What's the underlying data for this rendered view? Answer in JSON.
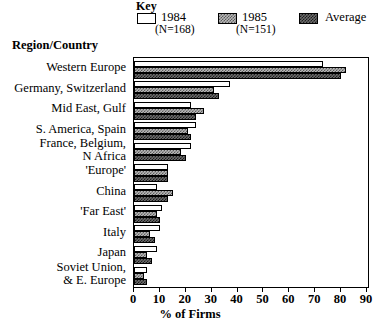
{
  "legend": {
    "title": "Key",
    "entries": [
      {
        "label": "1984",
        "sub": "(N=168)",
        "swatch": "white-open-box",
        "color": "#ffffff"
      },
      {
        "label": "1985",
        "sub": "(N=151)",
        "swatch": "light-checker-box",
        "color": "#b9b9b9"
      },
      {
        "label": "Average",
        "sub": "",
        "swatch": "dark-checker-box",
        "color": "#6d6d6d"
      }
    ]
  },
  "axis_titles": {
    "y": "Region/Country",
    "x": "% of Firms"
  },
  "x_ticks": [
    "0",
    "10",
    "20",
    "30",
    "40",
    "50",
    "60",
    "70",
    "80",
    "90"
  ],
  "categories": [
    "Western Europe",
    "Germany, Switzerland",
    "Mid East, Gulf",
    "S. America, Spain",
    "France, Belgium,\nN Africa",
    "'Europe'",
    "China",
    "'Far East'",
    "Italy",
    "Japan",
    "Soviet Union,\n& E. Europe"
  ],
  "chart_data": {
    "type": "bar",
    "orientation": "horizontal",
    "title": "",
    "xlabel": "% of Firms",
    "ylabel": "Region/Country",
    "xlim": [
      0,
      90
    ],
    "xticks": [
      0,
      10,
      20,
      30,
      40,
      50,
      60,
      70,
      80,
      90
    ],
    "grid": false,
    "legend_position": "top",
    "categories": [
      "Western Europe",
      "Germany, Switzerland",
      "Mid East, Gulf",
      "S. America, Spain",
      "France, Belgium, N Africa",
      "'Europe'",
      "China",
      "'Far East'",
      "Italy",
      "Japan",
      "Soviet Union, & E. Europe"
    ],
    "series": [
      {
        "name": "1984",
        "note": "(N=168)",
        "values": [
          73,
          37,
          22,
          24,
          22,
          13,
          9,
          11,
          10,
          9,
          5
        ]
      },
      {
        "name": "1985",
        "note": "(N=151)",
        "values": [
          82,
          31,
          27,
          21,
          18,
          13,
          15,
          9,
          6,
          5,
          4
        ]
      },
      {
        "name": "Average",
        "note": "",
        "values": [
          80,
          33,
          24,
          22,
          20,
          13,
          13,
          10,
          8,
          7,
          5
        ]
      }
    ]
  }
}
